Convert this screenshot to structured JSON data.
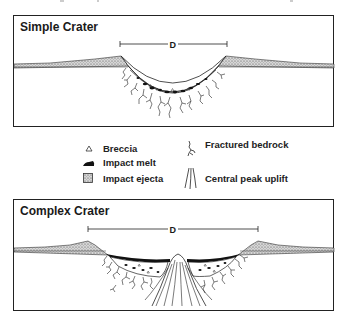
{
  "figure": {
    "panels": [
      {
        "id": "simple",
        "title": "Simple Crater",
        "diameter_label": "D"
      },
      {
        "id": "complex",
        "title": "Complex Crater",
        "diameter_label": "D"
      }
    ],
    "legend": {
      "items": [
        {
          "icon": "triangle-icon",
          "label": "Breccia"
        },
        {
          "icon": "impact-melt-icon",
          "label": "Impact melt"
        },
        {
          "icon": "stipple-square-icon",
          "label": "Impact ejecta"
        },
        {
          "icon": "fracture-icon",
          "label": "Fractured bedrock"
        },
        {
          "icon": "uplift-lines-icon",
          "label": "Central peak uplift"
        }
      ]
    },
    "colors": {
      "line": "#1a1a1a",
      "ejecta_fill": "#c8c8c8",
      "melt_fill": "#111111",
      "background": "#ffffff"
    }
  }
}
